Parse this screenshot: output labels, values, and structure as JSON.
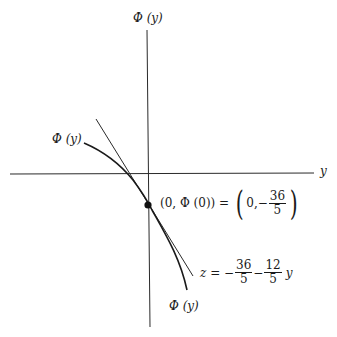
{
  "axes": {
    "vertical_label": "Φ (y)",
    "horizontal_label": "y"
  },
  "curve": {
    "label_upper": "Φ (y)",
    "label_lower": "Φ (y)"
  },
  "point": {
    "label_left": "(0, Φ (0)) =",
    "coord_x": "0,",
    "coord_sign": "−",
    "coord_num": "36",
    "coord_den": "5"
  },
  "tangent": {
    "lhs": "z = −",
    "frac1_num": "36",
    "frac1_den": "5",
    "minus": "−",
    "frac2_num": "12",
    "frac2_den": "5",
    "var": "y"
  },
  "colors": {
    "ink": "#1a1a1a",
    "background": "#ffffff"
  }
}
